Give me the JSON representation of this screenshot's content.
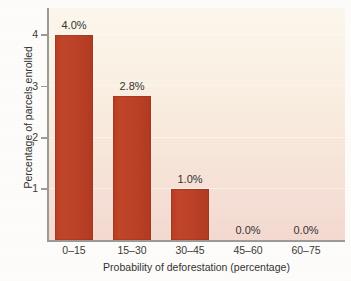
{
  "chart_data": {
    "type": "bar",
    "title": "",
    "subtitle": "",
    "xlabel": "Probability of deforestation (percentage)",
    "ylabel": "Percentage of parcels enrolled",
    "categories": [
      "0–15",
      "15–30",
      "30–45",
      "45–60",
      "60–75"
    ],
    "values": [
      4.0,
      2.8,
      1.0,
      0.0,
      0.0
    ],
    "data_labels": [
      "4.0%",
      "2.8%",
      "1.0%",
      "0.0%",
      "0.0%"
    ],
    "ylim": [
      0,
      4.5
    ],
    "yticks": [
      1,
      2,
      3,
      4
    ],
    "ytick_labels": [
      "1",
      "2",
      "3",
      "4"
    ],
    "grid": false,
    "legend": null,
    "legend_position": "none",
    "bar_color": "#bf4228",
    "plot_bg_top": "#fcf7ec",
    "plot_bg_bottom": "#f3d9d0",
    "axis_color": "#9a9a96",
    "text_color": "#333331"
  }
}
